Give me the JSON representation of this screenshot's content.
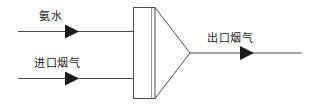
{
  "diagram": {
    "type": "process-flow-diagram",
    "background_color": "#ffffff",
    "line_color": "#4a4a4a",
    "arrow_color": "#1a1a1a",
    "text_color": "#1a1a1a",
    "labels": {
      "ammonia": "氨水",
      "inlet_flue_gas": "进口烟气",
      "outlet_flue_gas": "出口烟气"
    },
    "streams": [
      {
        "name": "ammonia-stream",
        "label": "氨水",
        "direction": "right",
        "y": 31
      },
      {
        "name": "inlet-flue-gas-stream",
        "label": "进口烟气",
        "direction": "right",
        "y": 78
      },
      {
        "name": "outlet-flue-gas-stream",
        "label": "出口烟气",
        "direction": "right",
        "y": 53
      }
    ],
    "vessel": {
      "name": "reactor-body",
      "shape": "rectangle-with-converging-cone",
      "rect": {
        "x": 133,
        "y": 7,
        "width": 22,
        "height": 92
      },
      "divider_x": 151,
      "cone_apex": {
        "x": 190,
        "y": 53
      }
    }
  }
}
